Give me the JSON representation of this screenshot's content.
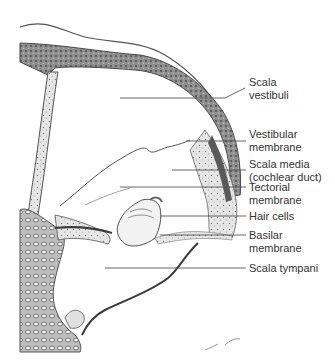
{
  "figure": {
    "labels": [
      {
        "id": "scala-vestibuli",
        "lines": [
          "Scala",
          "vestibuli"
        ],
        "top": 76
      },
      {
        "id": "vestibular-membrane",
        "lines": [
          "Vestibular",
          "membrane"
        ],
        "top": 128
      },
      {
        "id": "scala-media",
        "lines": [
          "Scala media",
          "(cochlear duct)"
        ],
        "top": 158
      },
      {
        "id": "tectorial-membrane",
        "lines": [
          "Tectorial",
          "membrane"
        ],
        "top": 181
      },
      {
        "id": "hair-cells",
        "lines": [
          "Hair cells"
        ],
        "top": 210
      },
      {
        "id": "basilar-membrane",
        "lines": [
          "Basilar",
          "membrane"
        ],
        "top": 229
      },
      {
        "id": "scala-tympani",
        "lines": [
          "Scala tympani"
        ],
        "top": 262
      }
    ],
    "colors": {
      "tissue_dark": "#4a4a4a",
      "tissue_mid": "#8a8a8a",
      "tissue_light": "#c8c8c8",
      "leader_line": "#555555",
      "text": "#333333"
    }
  }
}
